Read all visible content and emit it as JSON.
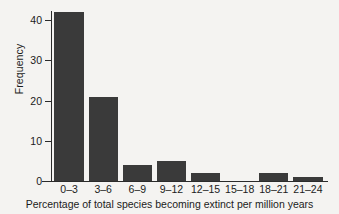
{
  "chart_data": {
    "type": "bar",
    "title": "",
    "subtitle": "",
    "xlabel": "Percentage of total species becoming extinct per million years",
    "ylabel": "Frequency",
    "categories": [
      "0–3",
      "3–6",
      "6–9",
      "9–12",
      "12–15",
      "15–18",
      "18–21",
      "21–24"
    ],
    "values": [
      42,
      21,
      4,
      5,
      2,
      0,
      2,
      1
    ],
    "ylim": [
      0,
      42
    ],
    "yticks": [
      0,
      10,
      20,
      30,
      40
    ],
    "ytick_labels": [
      "0",
      "10",
      "20",
      "30",
      "40"
    ],
    "xtick_labels": [
      "0–3",
      "3–6",
      "6–9",
      "9–12",
      "12–15",
      "15–18",
      "18–21",
      "21–24"
    ],
    "grid": false,
    "legend": null,
    "legend_position": "none",
    "annotations": [],
    "colors": {
      "bar_fill": "#3a3a3a",
      "axis": "#2b2b2b",
      "text": "#1b1b1b",
      "background": "#f4f3f1"
    }
  }
}
